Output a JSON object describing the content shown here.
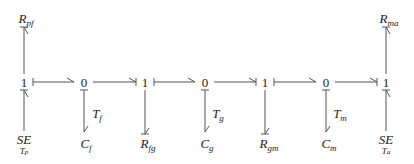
{
  "diagram": {
    "type": "bond-graph",
    "junctions": [
      {
        "id": "j1",
        "label": "1",
        "x": 24
      },
      {
        "id": "j2",
        "label": "0",
        "x": 84
      },
      {
        "id": "j3",
        "label": "1",
        "x": 145
      },
      {
        "id": "j4",
        "label": "0",
        "x": 205
      },
      {
        "id": "j5",
        "label": "1",
        "x": 265
      },
      {
        "id": "j6",
        "label": "0",
        "x": 326
      },
      {
        "id": "j7",
        "label": "1",
        "x": 386
      }
    ],
    "top_elements": [
      {
        "id": "rpf",
        "base": "R",
        "sub": "pf",
        "attached_to": "j1"
      },
      {
        "id": "rma",
        "base": "R",
        "sub": "ma",
        "attached_to": "j7"
      }
    ],
    "bottom_elements": [
      {
        "id": "sep",
        "base": "SE",
        "under": "T",
        "under_sub": "p",
        "attached_to": "j1"
      },
      {
        "id": "cf",
        "base": "C",
        "sub": "f",
        "attached_to": "j2",
        "bond_label": "T",
        "bond_label_sub": "f"
      },
      {
        "id": "rfg",
        "base": "R",
        "sub": "fg",
        "attached_to": "j3"
      },
      {
        "id": "cg",
        "base": "C",
        "sub": "g",
        "attached_to": "j4",
        "bond_label": "T",
        "bond_label_sub": "g"
      },
      {
        "id": "rgm",
        "base": "R",
        "sub": "gm",
        "attached_to": "j5"
      },
      {
        "id": "cm",
        "base": "C",
        "sub": "m",
        "attached_to": "j6",
        "bond_label": "T",
        "bond_label_sub": "m"
      },
      {
        "id": "sea",
        "base": "SE",
        "under": "T",
        "under_sub": "a",
        "attached_to": "j7"
      }
    ],
    "stroke_color": "#555555",
    "text_color": "#1a1a1a"
  }
}
